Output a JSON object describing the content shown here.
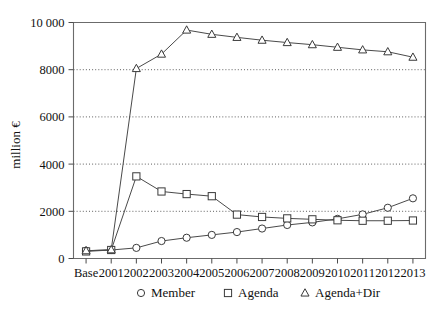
{
  "chart_data": {
    "type": "line",
    "title": "",
    "subtitle": "",
    "xlabel": "",
    "ylabel": "million €",
    "categories": [
      "Base",
      "2001",
      "2002",
      "2003",
      "2004",
      "2005",
      "2006",
      "2007",
      "2008",
      "2009",
      "2010",
      "2011",
      "2012",
      "2013"
    ],
    "x_tick_labels": [
      "Base",
      "2001",
      "2002",
      "2003",
      "2004",
      "2005",
      "2006",
      "2007",
      "2008",
      "2009",
      "2010",
      "2011",
      "2012",
      "2013"
    ],
    "y_tick_labels": [
      "0",
      "2000",
      "4000",
      "6000",
      "8000",
      "10 000"
    ],
    "y_tick_values": [
      0,
      2000,
      4000,
      6000,
      8000,
      10000
    ],
    "ylim": [
      0,
      10000
    ],
    "grid": "horizontal-dotted",
    "legend_position": "bottom-center",
    "series": [
      {
        "name": "Member",
        "marker": "circle",
        "values": [
          330,
          360,
          450,
          740,
          880,
          1000,
          1120,
          1270,
          1420,
          1530,
          1680,
          1870,
          2150,
          2550
        ]
      },
      {
        "name": "Agenda",
        "marker": "square",
        "values": [
          300,
          360,
          3480,
          2840,
          2730,
          2640,
          1860,
          1760,
          1700,
          1660,
          1620,
          1600,
          1600,
          1610
        ]
      },
      {
        "name": "Agenda+Dir",
        "marker": "triangle",
        "values": [
          330,
          370,
          8050,
          8660,
          9680,
          9500,
          9370,
          9250,
          9150,
          9060,
          8950,
          8840,
          8760,
          8530
        ]
      }
    ]
  },
  "legend": {
    "items": [
      {
        "label": "Member",
        "marker": "circle"
      },
      {
        "label": "Agenda",
        "marker": "square"
      },
      {
        "label": "Agenda+Dir",
        "marker": "triangle"
      }
    ]
  },
  "colors": {
    "background": "#ffffff",
    "axis": "#6b6b6b",
    "grid": "#4d4d4d",
    "series_stroke": "#3a3a3a",
    "marker_fill": "#ffffff",
    "text": "#111111"
  }
}
